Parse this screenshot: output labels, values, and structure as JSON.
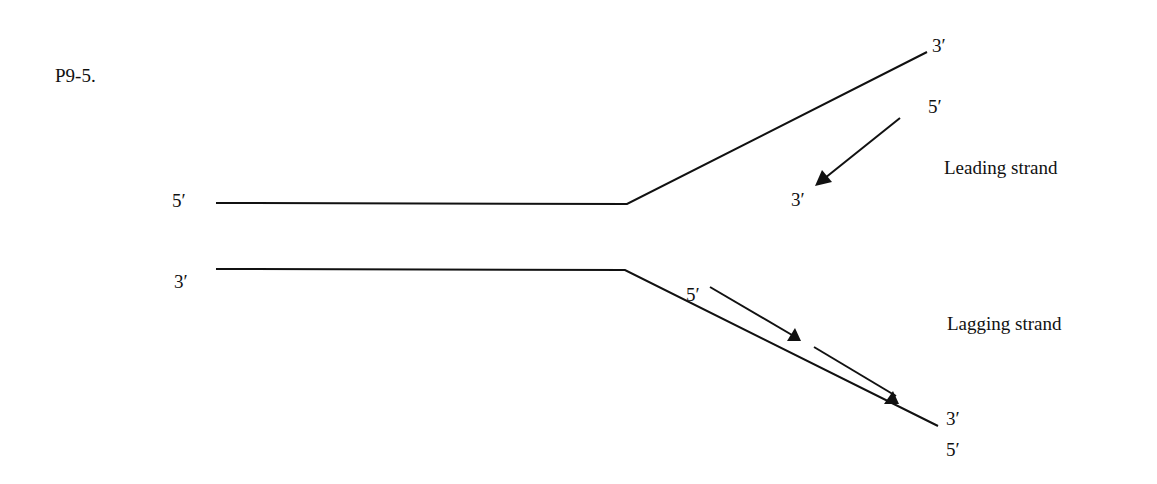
{
  "problem_label": "P9-5.",
  "template_strands": {
    "top": {
      "left_end": "5′",
      "right_end": "3′"
    },
    "bottom": {
      "left_end": "3′",
      "right_end": "5′"
    }
  },
  "leading": {
    "label": "Leading strand",
    "start": "5′",
    "end": "3′"
  },
  "lagging": {
    "label": "Lagging strand",
    "start": "5′",
    "end": "3′",
    "fragment_count": 2
  }
}
